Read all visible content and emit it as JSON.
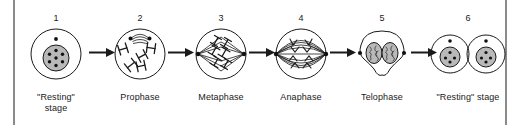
{
  "figure": {
    "background": "#ffffff",
    "frame_color": "#8a8a8a",
    "ink_color": "#1a1a1a",
    "nucleus_fill": "#b9b9b9",
    "connector": "arrow-right"
  },
  "stages": [
    {
      "number": "1",
      "label": "\"Resting\"\nstage",
      "icon": "cell-resting-stage",
      "has_arrow_after": true
    },
    {
      "number": "2",
      "label": "Prophase",
      "icon": "cell-prophase",
      "has_arrow_after": true
    },
    {
      "number": "3",
      "label": "Metaphase",
      "icon": "cell-metaphase",
      "has_arrow_after": true
    },
    {
      "number": "4",
      "label": "Anaphase",
      "icon": "cell-anaphase",
      "has_arrow_after": true
    },
    {
      "number": "5",
      "label": "Telophase",
      "icon": "cell-telophase",
      "has_arrow_after": true
    },
    {
      "number": "6",
      "label": "\"Resting\" stage",
      "icon": "cell-daughter-pair",
      "has_arrow_after": false
    }
  ]
}
